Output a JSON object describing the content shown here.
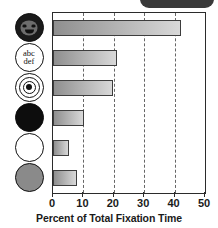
{
  "figure": {
    "top_tab": {
      "name": "partial-dark-rounded-tab",
      "color": "#3a3a3a"
    }
  },
  "chart_data": {
    "type": "bar",
    "orientation": "horizontal",
    "title": "",
    "xlabel": "Percent of Total Fixation Time",
    "ylabel": "",
    "xlim": [
      0,
      50
    ],
    "xticks": [
      0,
      10,
      20,
      30,
      40,
      50
    ],
    "xticklabels": [
      "0",
      "10",
      "20",
      "30",
      "40",
      "50"
    ],
    "grid": "vertical dashed gridlines at 10, 20, 30, 40",
    "legend": "none",
    "categories": [
      "face",
      "abc-def-text",
      "bullseye",
      "black-disc",
      "white-disc",
      "gray-disc"
    ],
    "category_icons": [
      "face-icon",
      "text-abcdef-icon",
      "bullseye-icon",
      "black-circle-icon",
      "white-circle-icon",
      "gray-circle-icon"
    ],
    "values": [
      42.0,
      21.0,
      19.7,
      10.2,
      5.2,
      7.9
    ],
    "bar_fill": "gray gradient left-dark to right-light",
    "bar_edge": "#3d3d3d"
  },
  "icons": {
    "face": {
      "label_top": "",
      "label_bottom": ""
    },
    "text_disc": {
      "line1": "abc",
      "line2": "def"
    }
  },
  "axis": {
    "tick_labels": [
      "0",
      "10",
      "20",
      "30",
      "40",
      "50"
    ],
    "title": "Percent of Total Fixation Time"
  }
}
